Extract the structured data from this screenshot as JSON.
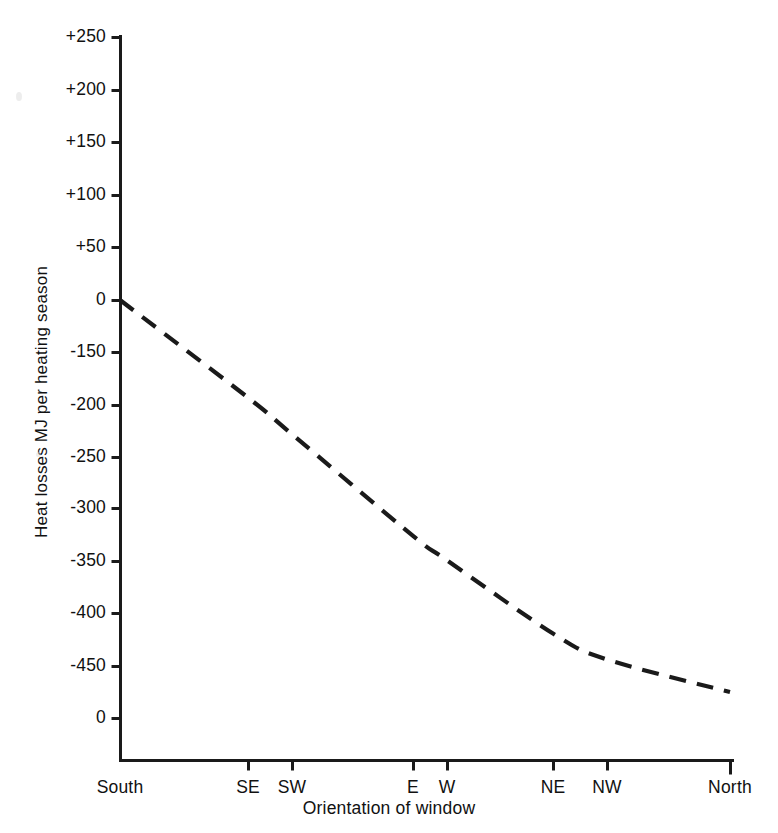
{
  "figure": {
    "background_color": "#ffffff",
    "ink_color": "#1a1a1a"
  },
  "chart_data": {
    "type": "line",
    "title": "",
    "subtitle": "",
    "xlabel": "Orientation of window",
    "ylabel": "Heat losses MJ per heating season",
    "line_style": "dashed",
    "line_color": "#1a1a1a",
    "grid": false,
    "legend": null,
    "legend_position": "none",
    "categories": [
      "South",
      "SE",
      "SW",
      "E",
      "W",
      "NE",
      "NW",
      "North"
    ],
    "x": [
      0,
      1,
      2,
      3,
      4,
      5,
      6,
      7
    ],
    "x_pixel_positions": [
      120,
      248,
      292,
      413,
      447,
      553,
      607,
      730
    ],
    "values": [
      0,
      -120,
      -165,
      -290,
      -320,
      -410,
      -442,
      -482
    ],
    "series": [
      {
        "name": "Heat losses",
        "values": [
          0,
          -120,
          -165,
          -290,
          -320,
          -410,
          -442,
          -482
        ]
      }
    ],
    "ylim": [
      -500,
      250
    ],
    "ytick_labels": [
      "+250",
      "+200",
      "+150",
      "+100",
      "+50",
      "0",
      "-150",
      "-200",
      "-250",
      "-300",
      "-350",
      "-400",
      "-450",
      "0"
    ],
    "ytick_values": [
      250,
      200,
      150,
      100,
      50,
      0,
      -150,
      -200,
      -250,
      -300,
      -350,
      -400,
      -450,
      -500
    ],
    "xtick_labels": [
      "South",
      "SE",
      "SW",
      "E",
      "W",
      "NE",
      "NW",
      "North"
    ]
  },
  "axes": {
    "y_title": "Heat losses MJ per heating season",
    "x_title": "Orientation of window",
    "y_ticks": [
      {
        "label": "+250",
        "y": 37
      },
      {
        "label": "+200",
        "y": 90
      },
      {
        "label": "+150",
        "y": 142
      },
      {
        "label": "+100",
        "y": 195
      },
      {
        "label": "+50",
        "y": 247
      },
      {
        "label": "0",
        "y": 300
      },
      {
        "label": "-150",
        "y": 352
      },
      {
        "label": "-200",
        "y": 405
      },
      {
        "label": "-250",
        "y": 457
      },
      {
        "label": "-300",
        "y": 508
      },
      {
        "label": "-350",
        "y": 561
      },
      {
        "label": "-400",
        "y": 613
      },
      {
        "label": "-450",
        "y": 666
      },
      {
        "label": "0",
        "y": 718
      }
    ],
    "x_ticks": [
      {
        "label": "South",
        "x": 120
      },
      {
        "label": "SE",
        "x": 248
      },
      {
        "label": "SW",
        "x": 292
      },
      {
        "label": "E",
        "x": 413
      },
      {
        "label": "W",
        "x": 447
      },
      {
        "label": "NE",
        "x": 553
      },
      {
        "label": "NW",
        "x": 607
      },
      {
        "label": "North",
        "x": 730
      }
    ]
  }
}
